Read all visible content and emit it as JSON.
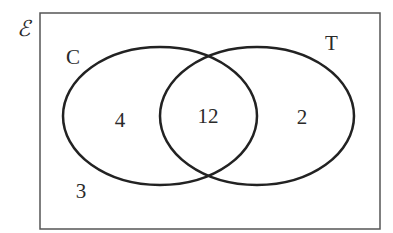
{
  "diagram": {
    "type": "venn",
    "universal_symbol": "ℰ",
    "sets": [
      {
        "name": "C",
        "label": "C"
      },
      {
        "name": "T",
        "label": "T"
      }
    ],
    "regions": {
      "only_C": "4",
      "both_C_and_T": "12",
      "only_T": "2",
      "neither": "3"
    },
    "colors": {
      "stroke": "#222222",
      "border": "#555555",
      "text": "#2a2a2a"
    }
  }
}
